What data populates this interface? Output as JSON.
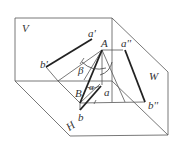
{
  "diagram": {
    "type": "three-plane orthographic projection of line segment AB",
    "planes": {
      "V": "V",
      "H": "H",
      "W": "W"
    },
    "points": {
      "A": "A",
      "B": "B",
      "a_prime": "a'",
      "b_prime": "b'",
      "a": "a",
      "b": "b",
      "a_double_prime": "a''",
      "b_double_prime": "b''"
    },
    "angles": {
      "alpha": "α",
      "beta": "β"
    }
  }
}
